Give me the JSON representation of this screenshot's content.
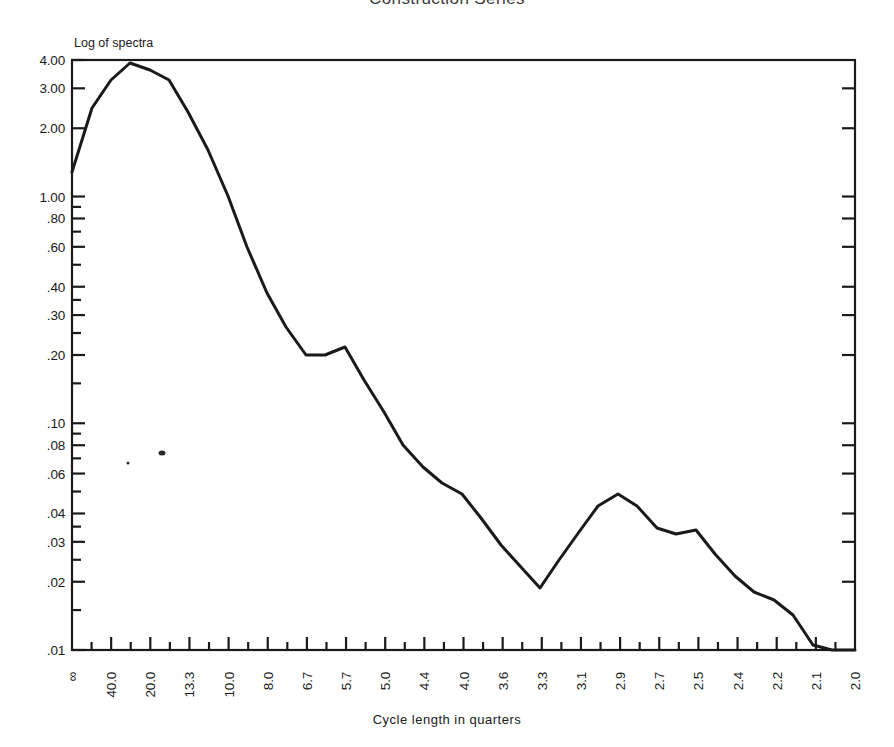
{
  "title": "Construction Series",
  "axis": {
    "y_title": "Log of spectra",
    "x_title": "Cycle length in quarters"
  },
  "chart_data": {
    "type": "line",
    "title": "Construction Series",
    "xlabel": "Cycle length in quarters",
    "ylabel": "Log of spectra",
    "yscale": "log",
    "ylim": [
      0.01,
      4.0
    ],
    "grid": false,
    "legend": null,
    "y_tick_labels": [
      "4.00",
      "3.00",
      "2.00",
      "1.00",
      ".80",
      ".60",
      ".40",
      ".30",
      ".20",
      ".10",
      ".08",
      ".06",
      ".04",
      ".03",
      ".02",
      ".01"
    ],
    "y_tick_values": [
      4.0,
      3.0,
      2.0,
      1.0,
      0.8,
      0.6,
      0.4,
      0.3,
      0.2,
      0.1,
      0.08,
      0.06,
      0.04,
      0.03,
      0.02,
      0.01
    ],
    "x_tick_labels": [
      "∞",
      "40.0",
      "20.0",
      "13.3",
      "10.0",
      "8.0",
      "6.7",
      "5.7",
      "5.0",
      "4.4",
      "4.0",
      "3.6",
      "3.3",
      "3.1",
      "2.9",
      "2.7",
      "2.5",
      "2.4",
      "2.2",
      "2.1",
      "2.0"
    ],
    "categories": [
      "∞",
      "40.0",
      "20.0",
      "13.3",
      "10.0",
      "8.0",
      "6.7",
      "5.7",
      "5.0",
      "4.4",
      "4.0",
      "3.6",
      "3.3",
      "3.1",
      "2.9",
      "2.7",
      "2.5",
      "2.4",
      "2.2",
      "2.1",
      "2.0"
    ],
    "values": [
      1.25,
      3.7,
      3.35,
      1.3,
      0.62,
      0.225,
      0.235,
      0.125,
      0.075,
      0.058,
      0.043,
      0.024,
      0.036,
      0.059,
      0.042,
      0.034,
      0.025,
      0.019,
      0.0155,
      0.0105,
      0.0105
    ],
    "series": [
      {
        "name": "Construction Series",
        "values": [
          1.25,
          3.7,
          3.35,
          1.3,
          0.62,
          0.225,
          0.235,
          0.125,
          0.075,
          0.058,
          0.043,
          0.024,
          0.036,
          0.059,
          0.042,
          0.034,
          0.025,
          0.019,
          0.0155,
          0.0105,
          0.0105
        ]
      }
    ],
    "points_px": [
      [
        72,
        172
      ],
      [
        92,
        108
      ],
      [
        111,
        80
      ],
      [
        130,
        63
      ],
      [
        150,
        70
      ],
      [
        169,
        80
      ],
      [
        188,
        112
      ],
      [
        208,
        150
      ],
      [
        228,
        196
      ],
      [
        247,
        247
      ],
      [
        267,
        293
      ],
      [
        286,
        327
      ],
      [
        306,
        355
      ],
      [
        325,
        355
      ],
      [
        345,
        347
      ],
      [
        364,
        380
      ],
      [
        384,
        412
      ],
      [
        403,
        445
      ],
      [
        423,
        467
      ],
      [
        442,
        483
      ],
      [
        462,
        494
      ],
      [
        481,
        518
      ],
      [
        501,
        545
      ],
      [
        520,
        566
      ],
      [
        540,
        588
      ],
      [
        559,
        560
      ],
      [
        579,
        532
      ],
      [
        598,
        506
      ],
      [
        618,
        494
      ],
      [
        637,
        506
      ],
      [
        657,
        528
      ],
      [
        676,
        534
      ],
      [
        696,
        530
      ],
      [
        715,
        554
      ],
      [
        735,
        576
      ],
      [
        754,
        592
      ],
      [
        774,
        600
      ],
      [
        793,
        615
      ],
      [
        813,
        645
      ],
      [
        832,
        650
      ],
      [
        855,
        650
      ]
    ],
    "series_color": "#1a1a1a",
    "line_width_px": 3
  },
  "artifacts": [
    {
      "name": "speck",
      "x": 162,
      "y": 453,
      "w": 7,
      "h": 5
    },
    {
      "name": "speck",
      "x": 128,
      "y": 463,
      "w": 3,
      "h": 3
    }
  ]
}
